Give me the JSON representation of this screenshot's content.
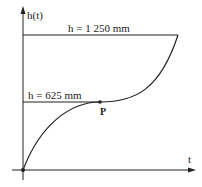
{
  "diagram": {
    "y_axis_label": "h(t)",
    "x_axis_label": "t",
    "top_level_label": "h = 1 250 mm",
    "mid_level_label": "h = 625 mm",
    "point_label": "P"
  }
}
